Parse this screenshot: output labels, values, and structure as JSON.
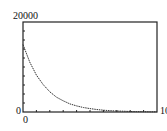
{
  "chart_data": {
    "type": "line",
    "title": "",
    "xlabel": "",
    "ylabel": "",
    "xlim": [
      0,
      10
    ],
    "ylim": [
      0,
      20000
    ],
    "x_tick_labels": [
      "0",
      "10"
    ],
    "y_tick_labels": [
      "0",
      "20000"
    ],
    "grid": false,
    "series": [
      {
        "name": "decay",
        "x": [
          0,
          0.5,
          1,
          1.5,
          2,
          2.5,
          3,
          3.5,
          4,
          4.5,
          5,
          5.5,
          6,
          6.5,
          7,
          7.5,
          8,
          8.5,
          9,
          9.5,
          10
        ],
        "values": [
          15000,
          11100,
          8200,
          6100,
          4500,
          3300,
          2500,
          1800,
          1350,
          1000,
          750,
          550,
          400,
          300,
          220,
          170,
          120,
          90,
          70,
          50,
          40
        ]
      }
    ]
  },
  "labels": {
    "y_max": "20000",
    "y_min": "0",
    "x_min": "0",
    "x_max": "10"
  }
}
